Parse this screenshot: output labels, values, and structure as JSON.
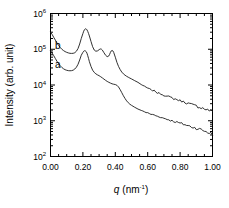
{
  "chart_data": {
    "type": "line",
    "title": "",
    "xlabel": "q (nm⁻¹)",
    "ylabel": "Intensity (arb. unit)",
    "xlabel_parts": {
      "symbol": "q",
      "unit": "(nm",
      "exponent": "-1",
      "close": ")"
    },
    "xscale": "linear",
    "yscale": "log",
    "xlim": [
      0.0,
      1.0
    ],
    "ylim": [
      100,
      1000000
    ],
    "grid": false,
    "legend_position": "inside-left",
    "x_ticks": [
      0.0,
      0.2,
      0.4,
      0.6,
      0.8,
      1.0
    ],
    "x_tick_labels": [
      "0.00",
      "0.20",
      "0.40",
      "0.60",
      "0.80",
      "1.00"
    ],
    "x_minor_step": 0.05,
    "y_ticks": [
      100,
      1000,
      10000,
      100000,
      1000000
    ],
    "y_tick_labels": [
      "10",
      "10",
      "10",
      "10",
      "10"
    ],
    "y_tick_exponents": [
      "2",
      "3",
      "4",
      "5",
      "6"
    ],
    "series": [
      {
        "name": "b",
        "label": "b",
        "label_q": 0.045,
        "label_intensity": 130000,
        "x": [
          0.0,
          0.01,
          0.02,
          0.03,
          0.04,
          0.05,
          0.06,
          0.07,
          0.08,
          0.09,
          0.1,
          0.11,
          0.12,
          0.13,
          0.14,
          0.15,
          0.16,
          0.17,
          0.18,
          0.19,
          0.2,
          0.205,
          0.21,
          0.215,
          0.22,
          0.225,
          0.23,
          0.235,
          0.24,
          0.25,
          0.26,
          0.27,
          0.28,
          0.29,
          0.3,
          0.305,
          0.31,
          0.315,
          0.32,
          0.33,
          0.34,
          0.35,
          0.36,
          0.365,
          0.37,
          0.375,
          0.38,
          0.385,
          0.39,
          0.4,
          0.41,
          0.42,
          0.43,
          0.44,
          0.45,
          0.46,
          0.47,
          0.48,
          0.49,
          0.5,
          0.52,
          0.54,
          0.56,
          0.57,
          0.58,
          0.59,
          0.6,
          0.61,
          0.62,
          0.63,
          0.64,
          0.65,
          0.66,
          0.67,
          0.68,
          0.69,
          0.7,
          0.71,
          0.72,
          0.73,
          0.74,
          0.75,
          0.76,
          0.77,
          0.78,
          0.79,
          0.8,
          0.81,
          0.82,
          0.83,
          0.84,
          0.85,
          0.86,
          0.87,
          0.88,
          0.89,
          0.9,
          0.91,
          0.92,
          0.93,
          0.94,
          0.95,
          0.96,
          0.97,
          0.98,
          0.99,
          1.0
        ],
        "y": [
          300000,
          260000,
          215000,
          180000,
          150000,
          128000,
          112000,
          100000,
          92000,
          86000,
          82000,
          79000,
          77000,
          76500,
          77000,
          80000,
          88000,
          105000,
          140000,
          200000,
          275000,
          320000,
          355000,
          372000,
          370000,
          350000,
          315000,
          275000,
          235000,
          165000,
          118000,
          95000,
          88000,
          90000,
          97000,
          101000,
          102000,
          100000,
          95000,
          80000,
          68000,
          62000,
          65000,
          72000,
          82000,
          90000,
          93000,
          90000,
          82000,
          60000,
          43000,
          33000,
          27000,
          23000,
          20500,
          18800,
          17500,
          16500,
          15600,
          14800,
          13200,
          11800,
          10400,
          9700,
          9100,
          8600,
          8200,
          7800,
          7300,
          7000,
          6900,
          6500,
          6000,
          5900,
          5700,
          5400,
          5200,
          5100,
          4800,
          4700,
          4500,
          4350,
          4150,
          4050,
          3900,
          3800,
          3650,
          3550,
          3400,
          3300,
          3200,
          3050,
          2950,
          2850,
          2750,
          2650,
          2600,
          2500,
          2400,
          2350,
          2250,
          2150,
          2100,
          2000,
          1950,
          1850,
          1800
        ]
      },
      {
        "name": "a",
        "label": "a",
        "label_q": 0.045,
        "label_intensity": 38000,
        "x": [
          0.0,
          0.01,
          0.02,
          0.03,
          0.04,
          0.05,
          0.06,
          0.07,
          0.08,
          0.09,
          0.1,
          0.11,
          0.12,
          0.13,
          0.14,
          0.15,
          0.16,
          0.17,
          0.18,
          0.19,
          0.2,
          0.205,
          0.21,
          0.215,
          0.22,
          0.225,
          0.23,
          0.235,
          0.24,
          0.25,
          0.26,
          0.27,
          0.28,
          0.29,
          0.3,
          0.31,
          0.32,
          0.33,
          0.34,
          0.35,
          0.36,
          0.37,
          0.38,
          0.39,
          0.4,
          0.41,
          0.42,
          0.43,
          0.44,
          0.45,
          0.46,
          0.47,
          0.48,
          0.49,
          0.5,
          0.52,
          0.54,
          0.56,
          0.57,
          0.58,
          0.59,
          0.6,
          0.61,
          0.62,
          0.63,
          0.64,
          0.65,
          0.66,
          0.67,
          0.68,
          0.69,
          0.7,
          0.71,
          0.72,
          0.73,
          0.74,
          0.75,
          0.76,
          0.77,
          0.78,
          0.79,
          0.8,
          0.81,
          0.82,
          0.83,
          0.84,
          0.85,
          0.86,
          0.87,
          0.88,
          0.89,
          0.9,
          0.91,
          0.92,
          0.93,
          0.94,
          0.95,
          0.96,
          0.97,
          0.98,
          0.99,
          1.0
        ],
        "y": [
          90000,
          78000,
          66000,
          55000,
          46000,
          39500,
          34500,
          31000,
          28500,
          26800,
          25800,
          25200,
          25000,
          25200,
          26000,
          28000,
          31500,
          38000,
          50000,
          68000,
          82000,
          88000,
          91000,
          90000,
          86000,
          78000,
          66000,
          55000,
          45000,
          33000,
          26000,
          22500,
          20500,
          19200,
          18200,
          17000,
          15800,
          14600,
          13500,
          12600,
          11900,
          11300,
          10800,
          10500,
          10300,
          9800,
          8800,
          7400,
          6100,
          5000,
          4200,
          3600,
          3200,
          2900,
          2700,
          2380,
          2150,
          1950,
          1870,
          1790,
          1710,
          1650,
          1580,
          1520,
          1480,
          1450,
          1390,
          1330,
          1300,
          1270,
          1210,
          1170,
          1140,
          1100,
          1070,
          1030,
          1000,
          970,
          940,
          910,
          880,
          850,
          830,
          800,
          780,
          750,
          720,
          700,
          680,
          660,
          640,
          620,
          600,
          580,
          560,
          540,
          520,
          500,
          480,
          460,
          440,
          420
        ]
      }
    ]
  },
  "figure": {
    "caption": "",
    "background": "#ffffff",
    "curve_color": "#1a1a1a",
    "axis_color": "#000000"
  }
}
